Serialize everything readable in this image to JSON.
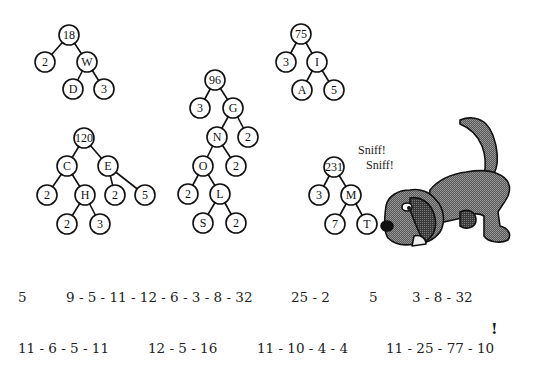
{
  "trees": [
    {
      "id": "tree-18",
      "nodes": [
        {
          "label": "18",
          "x": 69,
          "y": 35
        },
        {
          "label": "2",
          "x": 45,
          "y": 62
        },
        {
          "label": "W",
          "x": 87,
          "y": 62
        },
        {
          "label": "D",
          "x": 73,
          "y": 89
        },
        {
          "label": "3",
          "x": 104,
          "y": 89
        }
      ],
      "edges": [
        [
          0,
          1
        ],
        [
          0,
          2
        ],
        [
          2,
          3
        ],
        [
          2,
          4
        ]
      ]
    },
    {
      "id": "tree-120",
      "nodes": [
        {
          "label": "120",
          "x": 84,
          "y": 138
        },
        {
          "label": "C",
          "x": 67,
          "y": 166
        },
        {
          "label": "E",
          "x": 108,
          "y": 166
        },
        {
          "label": "2",
          "x": 47,
          "y": 195
        },
        {
          "label": "H",
          "x": 85,
          "y": 195
        },
        {
          "label": "2",
          "x": 115,
          "y": 195
        },
        {
          "label": "5",
          "x": 145,
          "y": 195
        },
        {
          "label": "2",
          "x": 67,
          "y": 224
        },
        {
          "label": "3",
          "x": 100,
          "y": 224
        }
      ],
      "edges": [
        [
          0,
          1
        ],
        [
          0,
          2
        ],
        [
          1,
          3
        ],
        [
          1,
          4
        ],
        [
          2,
          5
        ],
        [
          2,
          6
        ],
        [
          4,
          7
        ],
        [
          4,
          8
        ]
      ]
    },
    {
      "id": "tree-96",
      "nodes": [
        {
          "label": "96",
          "x": 215,
          "y": 80
        },
        {
          "label": "3",
          "x": 200,
          "y": 108
        },
        {
          "label": "G",
          "x": 233,
          "y": 108
        },
        {
          "label": "N",
          "x": 217,
          "y": 137
        },
        {
          "label": "2",
          "x": 248,
          "y": 137
        },
        {
          "label": "O",
          "x": 203,
          "y": 166
        },
        {
          "label": "2",
          "x": 236,
          "y": 166
        },
        {
          "label": "2",
          "x": 188,
          "y": 194
        },
        {
          "label": "L",
          "x": 220,
          "y": 194
        },
        {
          "label": "S",
          "x": 203,
          "y": 223
        },
        {
          "label": "2",
          "x": 236,
          "y": 223
        }
      ],
      "edges": [
        [
          0,
          1
        ],
        [
          0,
          2
        ],
        [
          2,
          3
        ],
        [
          2,
          4
        ],
        [
          3,
          5
        ],
        [
          3,
          6
        ],
        [
          5,
          7
        ],
        [
          5,
          8
        ],
        [
          8,
          9
        ],
        [
          8,
          10
        ]
      ]
    },
    {
      "id": "tree-75",
      "nodes": [
        {
          "label": "75",
          "x": 301,
          "y": 34
        },
        {
          "label": "3",
          "x": 286,
          "y": 62
        },
        {
          "label": "I",
          "x": 317,
          "y": 62
        },
        {
          "label": "A",
          "x": 302,
          "y": 90
        },
        {
          "label": "5",
          "x": 334,
          "y": 90
        }
      ],
      "edges": [
        [
          0,
          1
        ],
        [
          0,
          2
        ],
        [
          2,
          3
        ],
        [
          2,
          4
        ]
      ]
    },
    {
      "id": "tree-231",
      "nodes": [
        {
          "label": "231",
          "x": 334,
          "y": 167
        },
        {
          "label": "3",
          "x": 319,
          "y": 195
        },
        {
          "label": "M",
          "x": 351,
          "y": 195
        },
        {
          "label": "7",
          "x": 335,
          "y": 224
        },
        {
          "label": "T",
          "x": 367,
          "y": 224
        }
      ],
      "edges": [
        [
          0,
          1
        ],
        [
          0,
          2
        ],
        [
          2,
          3
        ],
        [
          2,
          4
        ]
      ]
    }
  ],
  "node_radius": 10,
  "illustration": {
    "subject": "dog-sniffing",
    "speech": [
      "Sniff!",
      "Sniff!"
    ]
  },
  "sequences": {
    "row1": [
      {
        "text": "5",
        "x": 18,
        "y": 289
      },
      {
        "text": "9 - 5 - 11 - 12 - 6 - 3 - 8 - 32",
        "x": 66,
        "y": 289
      },
      {
        "text": "25 - 2",
        "x": 291,
        "y": 289
      },
      {
        "text": "5",
        "x": 369,
        "y": 289
      },
      {
        "text": "3 - 8 - 32",
        "x": 412,
        "y": 289
      }
    ],
    "row2": [
      {
        "text": "11 - 6 - 5 - 11",
        "x": 18,
        "y": 340
      },
      {
        "text": "12 - 5 - 16",
        "x": 148,
        "y": 340
      },
      {
        "text": "11 - 10 - 4 - 4",
        "x": 257,
        "y": 340
      },
      {
        "text": "11 - 25 - 77 - 10",
        "x": 386,
        "y": 340
      }
    ],
    "exclamation": {
      "text": "!",
      "x": 491,
      "y": 320
    }
  }
}
